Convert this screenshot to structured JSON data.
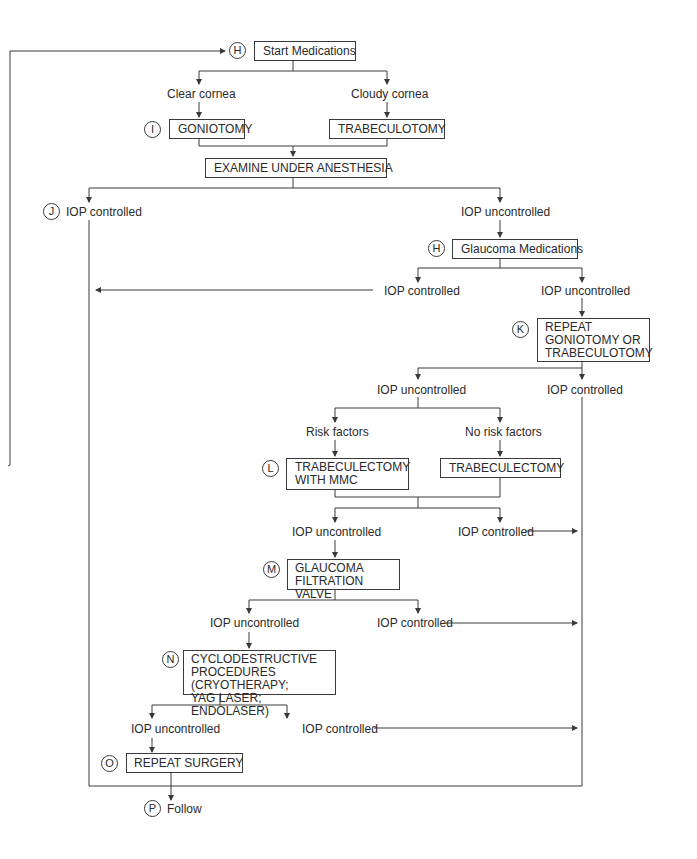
{
  "diagram": {
    "type": "flowchart",
    "title": "",
    "nodes": {
      "start_medications": {
        "marker": "H",
        "label": "Start Medications"
      },
      "clear_cornea": {
        "label": "Clear cornea"
      },
      "cloudy_cornea": {
        "label": "Cloudy cornea"
      },
      "goniotomy": {
        "marker": "I",
        "label": "GONIOTOMY"
      },
      "trabeculotomy": {
        "label": "TRABECULOTOMY"
      },
      "eua": {
        "label": "EXAMINE UNDER ANESTHESIA"
      },
      "iop_controlled_1": {
        "marker": "J",
        "label": "IOP controlled"
      },
      "iop_uncontrolled_1": {
        "label": "IOP uncontrolled"
      },
      "glaucoma_medications": {
        "marker": "H",
        "label": "Glaucoma Medications"
      },
      "iop_controlled_2": {
        "label": "IOP controlled"
      },
      "iop_uncontrolled_2": {
        "label": "IOP uncontrolled"
      },
      "repeat_gonio": {
        "marker": "K",
        "lines": [
          "REPEAT",
          "GONIOTOMY OR",
          "TRABECULOTOMY"
        ]
      },
      "iop_uncontrolled_3": {
        "label": "IOP uncontrolled"
      },
      "iop_controlled_3": {
        "label": "IOP controlled"
      },
      "risk_factors": {
        "label": "Risk factors"
      },
      "no_risk_factors": {
        "label": "No risk factors"
      },
      "trab_mmc": {
        "marker": "L",
        "lines": [
          "TRABECULECTOMY",
          "WITH MMC"
        ]
      },
      "trab": {
        "label": "TRABECULECTOMY"
      },
      "iop_uncontrolled_4": {
        "label": "IOP uncontrolled"
      },
      "iop_controlled_4": {
        "label": "IOP controlled"
      },
      "filtration_valve": {
        "marker": "M",
        "lines": [
          "GLAUCOMA",
          "FILTRATION VALVE"
        ]
      },
      "iop_uncontrolled_5": {
        "label": "IOP uncontrolled"
      },
      "iop_controlled_5": {
        "label": "IOP controlled"
      },
      "cyclodestructive": {
        "marker": "N",
        "lines": [
          "CYCLODESTRUCTIVE",
          "PROCEDURES (CRYOTHERAPY;",
          "YAG LASER; ENDOLASER)"
        ]
      },
      "iop_uncontrolled_6": {
        "label": "IOP uncontrolled"
      },
      "iop_controlled_6": {
        "label": "IOP controlled"
      },
      "repeat_surgery": {
        "marker": "O",
        "label": "REPEAT SURGERY"
      },
      "follow": {
        "marker": "P",
        "label": "Follow"
      }
    },
    "colors": {
      "line": "#3a3a3a",
      "text": "#2a2a2a",
      "background": "#ffffff"
    }
  }
}
